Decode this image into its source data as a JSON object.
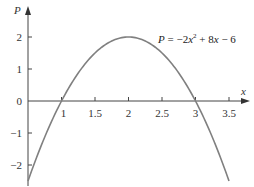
{
  "chart_data": {
    "type": "line",
    "title": "",
    "equation": "P = −2x² + 8x − 6",
    "equation_parts": {
      "lhs": "P",
      "eq": " = −2",
      "var": "x",
      "sup": "2",
      "rest": " + 8",
      "var2": "x",
      "tail": " − 6"
    },
    "xlabel": "x",
    "ylabel": "P",
    "xlim": [
      0.5,
      3.75
    ],
    "ylim": [
      -2.5,
      2.5
    ],
    "x_ticks": [
      1,
      1.5,
      2,
      2.5,
      3,
      3.5
    ],
    "x_tick_labels": [
      "1",
      "1.5",
      "2",
      "2.5",
      "3",
      "3.5"
    ],
    "y_ticks": [
      2,
      1,
      0,
      -1,
      -2
    ],
    "y_tick_labels": [
      "2",
      "1",
      "0",
      "−1",
      "−2"
    ],
    "grid": false,
    "series": [
      {
        "name": "P = -2x^2 + 8x - 6",
        "color": "#808080",
        "x": [
          0.5,
          0.75,
          1,
          1.25,
          1.5,
          1.75,
          2,
          2.25,
          2.5,
          2.75,
          3,
          3.25,
          3.5
        ],
        "values": [
          -2.5,
          -1.125,
          0,
          0.875,
          1.5,
          1.875,
          2,
          1.875,
          1.5,
          0.875,
          0,
          -1.125,
          -2.5
        ]
      }
    ]
  }
}
